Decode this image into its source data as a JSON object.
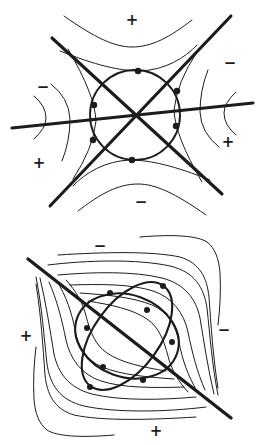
{
  "page": {
    "width": 267,
    "height": 445,
    "background": "#ffffff",
    "ink": "#1c1c1c"
  },
  "figures": [
    {
      "name": "saddle-phase-portrait",
      "signs": [
        {
          "label": "+",
          "x": 132,
          "y": 20
        },
        {
          "label": "−",
          "x": 230,
          "y": 63
        },
        {
          "label": "−",
          "x": 43,
          "y": 87
        },
        {
          "label": "+",
          "x": 228,
          "y": 142
        },
        {
          "label": "+",
          "x": 39,
          "y": 163
        },
        {
          "label": "−",
          "x": 141,
          "y": 202
        }
      ],
      "dots": [
        [
          138,
          71
        ],
        [
          177,
          91
        ],
        [
          176,
          126
        ],
        [
          132,
          160
        ],
        [
          93,
          140
        ],
        [
          94,
          105
        ]
      ],
      "dot_radius": 3.2
    },
    {
      "name": "degenerate-phase-portrait",
      "signs": [
        {
          "label": "−",
          "x": 100,
          "y": 23
        },
        {
          "label": "+",
          "x": 26,
          "y": 113
        },
        {
          "label": "−",
          "x": 224,
          "y": 107
        },
        {
          "label": "+",
          "x": 156,
          "y": 208
        }
      ],
      "dots": [
        [
          110,
          70
        ],
        [
          163,
          63
        ],
        [
          147,
          87
        ],
        [
          87,
          105
        ],
        [
          172,
          119
        ],
        [
          103,
          144
        ],
        [
          143,
          157
        ],
        [
          90,
          164
        ]
      ],
      "dot_radius": 3.0
    }
  ]
}
